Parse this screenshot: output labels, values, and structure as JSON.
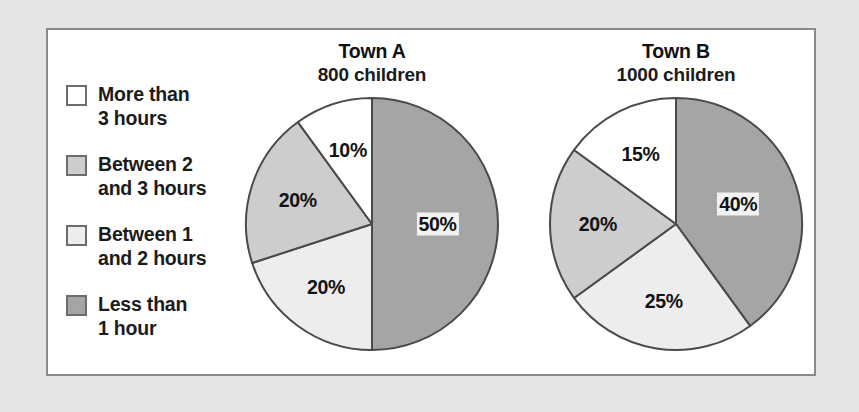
{
  "legend": {
    "items": [
      {
        "label": "More than\n3 hours",
        "color": "#ffffff",
        "swatch_name": "legend-swatch-more-than-3-hours"
      },
      {
        "label": "Between 2\nand 3 hours",
        "color": "#cdcdcd",
        "swatch_name": "legend-swatch-between-2-and-3-hours"
      },
      {
        "label": "Between 1\nand 2 hours",
        "color": "#ededed",
        "swatch_name": "legend-swatch-between-1-and-2-hours"
      },
      {
        "label": "Less than\n1 hour",
        "color": "#a5a5a5",
        "swatch_name": "legend-swatch-less-than-1-hour"
      }
    ]
  },
  "charts": [
    {
      "title": "Town A",
      "subtitle": "800 children",
      "labels": [
        "50%",
        "20%",
        "20%",
        "10%"
      ]
    },
    {
      "title": "Town B",
      "subtitle": "1000 children",
      "labels": [
        "40%",
        "25%",
        "20%",
        "15%"
      ]
    }
  ],
  "chart_data": [
    {
      "type": "pie",
      "title": "Town A",
      "subtitle": "800 children",
      "total_children": 800,
      "start_angle_deg": 0,
      "direction": "clockwise",
      "categories": [
        "Less than 1 hour",
        "Between 1 and 2 hours",
        "Between 2 and 3 hours",
        "More than 3 hours"
      ],
      "values": [
        50,
        20,
        20,
        10
      ],
      "value_labels": [
        "50%",
        "20%",
        "20%",
        "10%"
      ],
      "colors": [
        "#a5a5a5",
        "#ededed",
        "#cdcdcd",
        "#ffffff"
      ],
      "units": "percent",
      "legend_position": "left"
    },
    {
      "type": "pie",
      "title": "Town B",
      "subtitle": "1000 children",
      "total_children": 1000,
      "start_angle_deg": 0,
      "direction": "clockwise",
      "categories": [
        "Less than 1 hour",
        "Between 1 and 2 hours",
        "Between 2 and 3 hours",
        "More than 3 hours"
      ],
      "values": [
        40,
        25,
        20,
        15
      ],
      "value_labels": [
        "40%",
        "25%",
        "20%",
        "15%"
      ],
      "colors": [
        "#a5a5a5",
        "#ededed",
        "#cdcdcd",
        "#ffffff"
      ],
      "units": "percent",
      "legend_position": "left"
    }
  ],
  "style": {
    "page_background": "#e6e6e6",
    "panel_background": "#ffffff",
    "panel_border": "#8a8a8a",
    "slice_outline": "#4a4a4a",
    "text_color": "#131313"
  }
}
